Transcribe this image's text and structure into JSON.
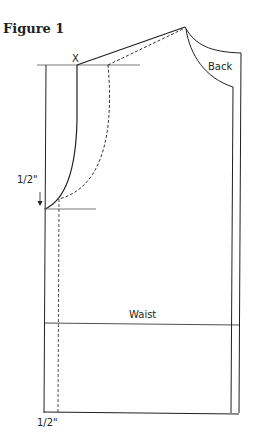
{
  "figure": {
    "title": "Figure 1",
    "labels": {
      "point_x": "X",
      "back": "Back",
      "armhole_drop": "1/2\"",
      "waist": "Waist",
      "hem_offset": "1/2\""
    },
    "colors": {
      "line": "#231f20",
      "guide": "#555555",
      "background": "#ffffff"
    }
  }
}
